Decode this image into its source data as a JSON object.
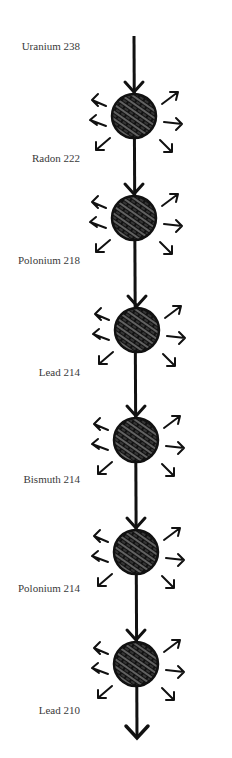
{
  "diagram": {
    "type": "decay-chain",
    "line_color": "#111111",
    "nuclei": [
      {
        "label": "Uranium 238",
        "label_y": 46,
        "circle_y": 116
      },
      {
        "label": "Radon 222",
        "label_y": 158,
        "circle_y": 218
      },
      {
        "label": "Polonium 218",
        "label_y": 260,
        "circle_y": 330
      },
      {
        "label": "Lead 214",
        "label_y": 372,
        "circle_y": 440
      },
      {
        "label": "Bismuth 214",
        "label_y": 479,
        "circle_y": 552
      },
      {
        "label": "Polonium 214",
        "label_y": 588,
        "circle_y": 664
      },
      {
        "label": "Lead 210",
        "label_y": 710
      }
    ]
  }
}
